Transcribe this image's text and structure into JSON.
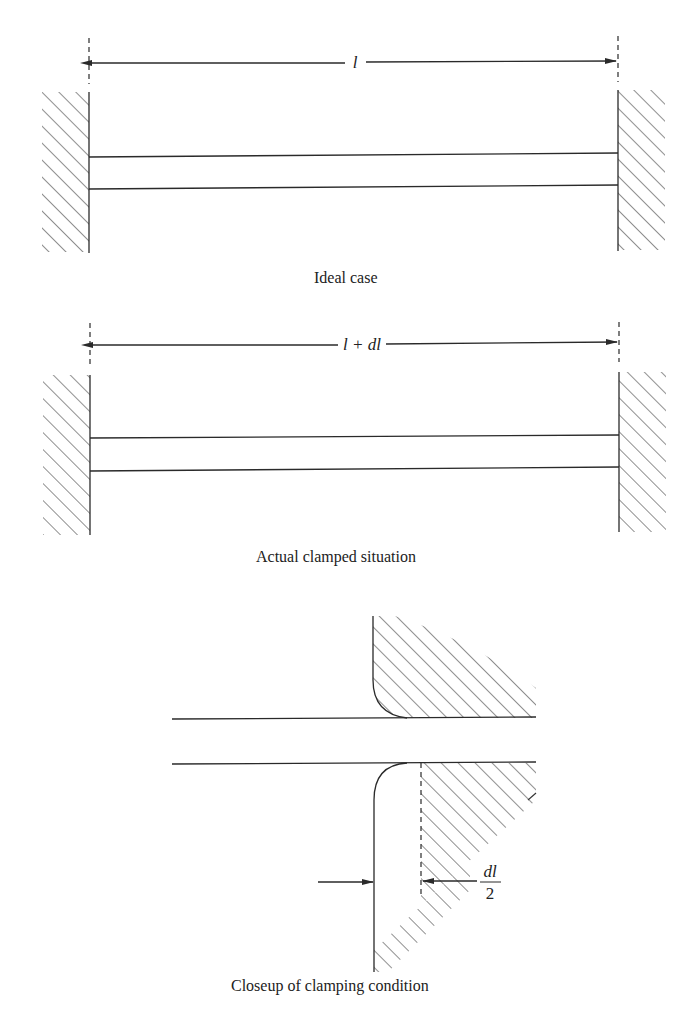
{
  "figure": {
    "panels": [
      {
        "id": "ideal",
        "caption": "Ideal case",
        "dimension_label": "l"
      },
      {
        "id": "actual",
        "caption": "Actual clamped situation",
        "dimension_label": "l + dl"
      },
      {
        "id": "closeup",
        "caption": "Closeup of clamping condition",
        "dimension_label_numerator": "dl",
        "dimension_label_denominator": "2"
      }
    ]
  },
  "colors": {
    "ink": "#2a2a2a",
    "background": "#ffffff"
  }
}
